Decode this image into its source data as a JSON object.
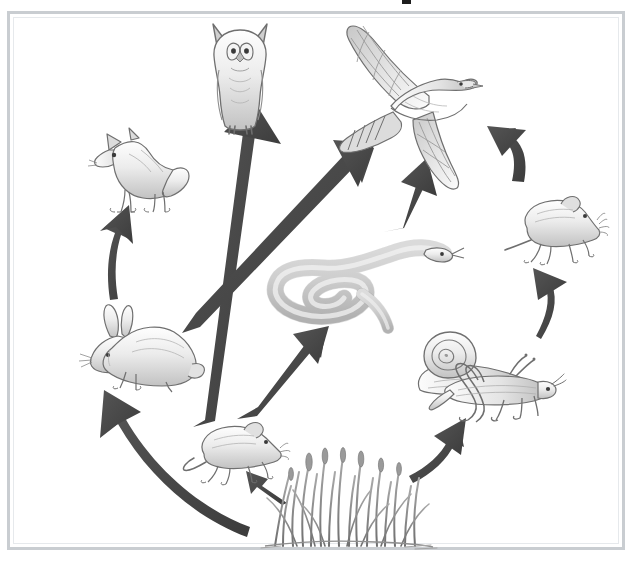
{
  "figure": {
    "type": "food-web-diagram",
    "title_fragment": ".",
    "frame_color": "#c9cdd1",
    "background_color": "#ffffff",
    "arrow_color": "#4a4a4a",
    "organism_outline_color": "#6b6b6b",
    "organism_fill_color": "#d8d8d8"
  },
  "organisms": [
    {
      "id": "owl",
      "label": "Owl",
      "icon": "owl-icon",
      "role": "tertiary consumer",
      "position": {
        "x": 205,
        "y": 22,
        "w": 70,
        "h": 108
      },
      "facing": "front"
    },
    {
      "id": "hawk",
      "label": "Hawk",
      "icon": "hawk-icon",
      "role": "tertiary consumer",
      "position": {
        "x": 333,
        "y": 24,
        "w": 142,
        "h": 168
      },
      "facing": "right"
    },
    {
      "id": "fox",
      "label": "Fox",
      "icon": "fox-icon",
      "role": "secondary consumer",
      "position": {
        "x": 85,
        "y": 128,
        "w": 104,
        "h": 84
      },
      "facing": "left"
    },
    {
      "id": "mouse-right",
      "label": "Mouse",
      "icon": "mouse-icon",
      "role": "primary consumer",
      "position": {
        "x": 503,
        "y": 190,
        "w": 104,
        "h": 80
      },
      "facing": "right"
    },
    {
      "id": "snake",
      "label": "Snake",
      "icon": "snake-icon",
      "role": "secondary consumer",
      "position": {
        "x": 256,
        "y": 236,
        "w": 210,
        "h": 96
      },
      "facing": "right"
    },
    {
      "id": "rabbit",
      "label": "Rabbit",
      "icon": "rabbit-icon",
      "role": "primary consumer",
      "position": {
        "x": 74,
        "y": 300,
        "w": 130,
        "h": 92
      },
      "facing": "left"
    },
    {
      "id": "snail",
      "label": "Snail",
      "icon": "snail-icon",
      "role": "primary consumer",
      "position": {
        "x": 414,
        "y": 330,
        "w": 116,
        "h": 76
      },
      "facing": "right"
    },
    {
      "id": "grasshopper",
      "label": "Grasshopper",
      "icon": "grasshopper-icon",
      "role": "primary consumer",
      "position": {
        "x": 428,
        "y": 362,
        "w": 132,
        "h": 62
      },
      "facing": "right"
    },
    {
      "id": "mouse-bottom",
      "label": "Mouse",
      "icon": "mouse-icon",
      "role": "primary consumer",
      "position": {
        "x": 182,
        "y": 420,
        "w": 106,
        "h": 68
      },
      "facing": "right"
    },
    {
      "id": "grass",
      "label": "Grass",
      "icon": "grass-icon",
      "role": "producer",
      "position": {
        "x": 265,
        "y": 450,
        "w": 165,
        "h": 98
      },
      "facing": "none"
    }
  ],
  "arrows": [
    {
      "id": "arrow-mouse-to-owl",
      "from": "mouse-bottom",
      "to": "owl",
      "style": "straight-long",
      "direction": "up"
    },
    {
      "id": "arrow-rabbit-to-hawk",
      "from": "rabbit",
      "to": "hawk",
      "style": "straight-long",
      "direction": "up-right"
    },
    {
      "id": "arrow-rabbit-to-fox",
      "from": "rabbit",
      "to": "fox",
      "style": "curved",
      "direction": "up"
    },
    {
      "id": "arrow-grass-to-rabbit",
      "from": "grass",
      "to": "rabbit",
      "style": "curved-long",
      "direction": "up-left"
    },
    {
      "id": "arrow-grass-to-mouse",
      "from": "grass",
      "to": "mouse-bottom",
      "style": "short",
      "direction": "up-left"
    },
    {
      "id": "arrow-mouse-to-snake",
      "from": "mouse-bottom",
      "to": "snake",
      "style": "straight",
      "direction": "up-right"
    },
    {
      "id": "arrow-snake-to-hawk",
      "from": "snake",
      "to": "hawk",
      "style": "straight",
      "direction": "up"
    },
    {
      "id": "arrow-mouseR-to-hawk",
      "from": "mouse-right",
      "to": "hawk",
      "style": "curved",
      "direction": "up-left"
    },
    {
      "id": "arrow-snail-to-mouseR",
      "from": "snail",
      "to": "mouse-right",
      "style": "curved",
      "direction": "up"
    },
    {
      "id": "arrow-grass-to-grasshopper",
      "from": "grass",
      "to": "grasshopper",
      "style": "curved",
      "direction": "up-right"
    }
  ]
}
